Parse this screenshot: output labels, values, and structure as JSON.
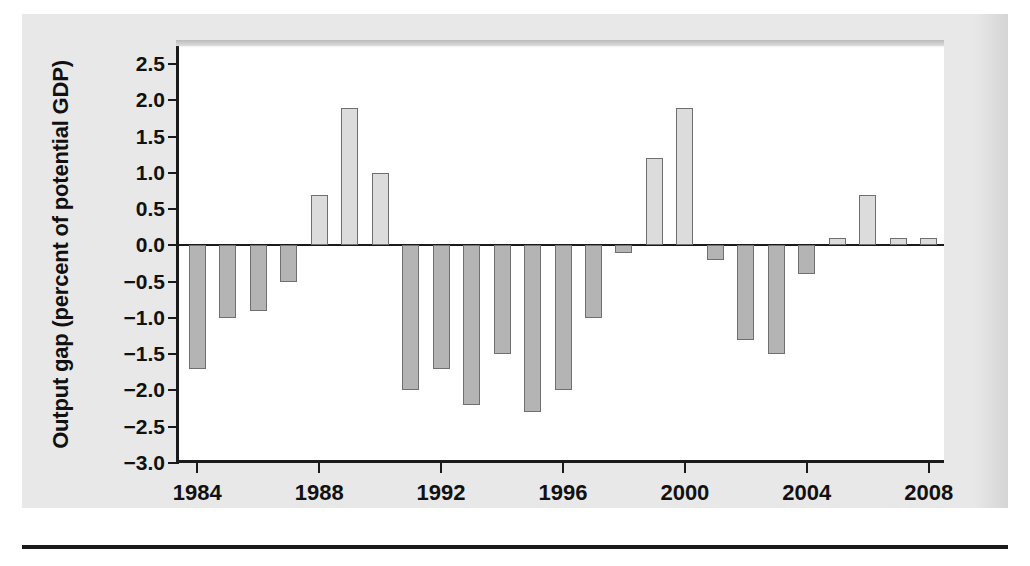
{
  "chart_data": {
    "type": "bar",
    "title": "",
    "xlabel": "",
    "ylabel": "Output gap (percent of potential GDP)",
    "ylim": [
      -3.0,
      2.75
    ],
    "xlim": [
      1983.4,
      2008.6
    ],
    "grid": false,
    "legend": null,
    "ytick_labels": [
      "2.5",
      "2.0",
      "1.5",
      "1.0",
      "0.5",
      "0.0",
      "−0.5",
      "−1.0",
      "−1.5",
      "−2.0",
      "−2.5",
      "−3.0"
    ],
    "ytick_values": [
      2.5,
      2.0,
      1.5,
      1.0,
      0.5,
      0.0,
      -0.5,
      -1.0,
      -1.5,
      -2.0,
      -2.5,
      -3.0
    ],
    "xtick_labels": [
      "1984",
      "1988",
      "1992",
      "1996",
      "2000",
      "2004",
      "2008"
    ],
    "xtick_values": [
      1984,
      1988,
      1992,
      1996,
      2000,
      2004,
      2008
    ],
    "categories": [
      1984,
      1985,
      1986,
      1987,
      1988,
      1989,
      1990,
      1991,
      1992,
      1993,
      1994,
      1995,
      1996,
      1997,
      1998,
      1999,
      2000,
      2001,
      2002,
      2003,
      2004,
      2005,
      2006,
      2007,
      2008
    ],
    "values": [
      -1.7,
      -1.0,
      -0.9,
      -0.5,
      0.7,
      1.9,
      1.0,
      -2.0,
      -1.7,
      -2.2,
      -1.5,
      -2.3,
      -2.0,
      -1.0,
      -0.1,
      1.2,
      1.9,
      -0.2,
      -1.3,
      -1.5,
      -0.4,
      0.1,
      0.7,
      0.1,
      0.1
    ],
    "colors": {
      "positive_bar": "#dcdcdc",
      "negative_bar": "#b4b4b4",
      "bar_border": "#6f6f6f",
      "axis": "#1a1a1a",
      "plot_background": "#ffffff",
      "page_background": "#e8e8e8",
      "text": "#111111"
    }
  }
}
